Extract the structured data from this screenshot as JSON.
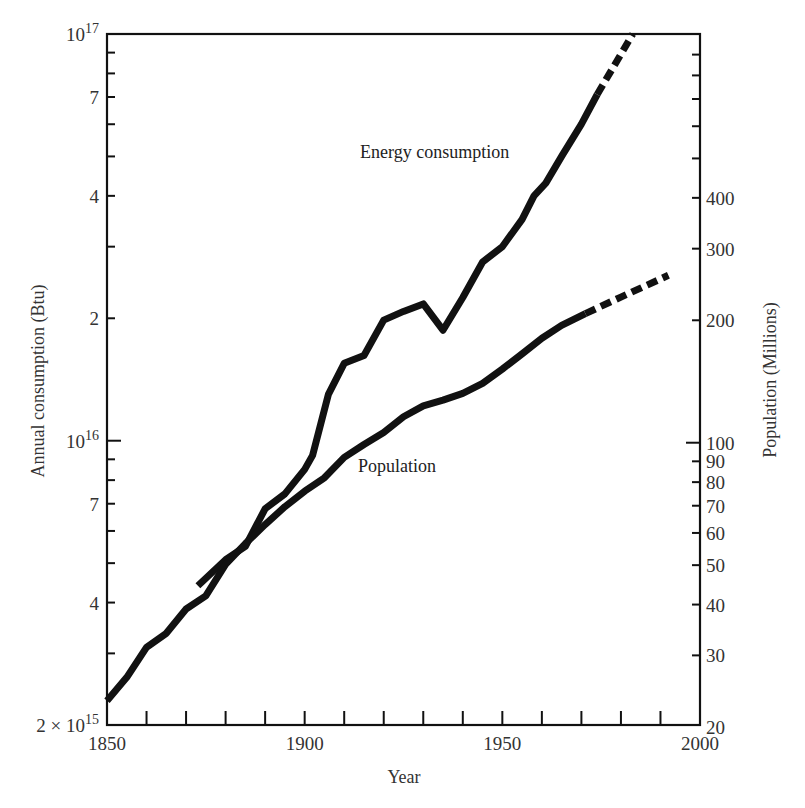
{
  "chart_data": {
    "type": "line",
    "title": "",
    "xlabel": "Year",
    "ylabel_left": "Annual consumption (Btu)",
    "ylabel_right": "Population (Millions)",
    "x_range": [
      1850,
      2000
    ],
    "x_ticks_major": [
      1850,
      1900,
      1950,
      2000
    ],
    "x_tick_step": 10,
    "y_left_scale": "log",
    "y_left_range": [
      2000000000000000.0,
      1e+17
    ],
    "y_left_ticks": [
      {
        "value": 2000000000000000.0,
        "label": "2 × 10",
        "sup": "15"
      },
      {
        "value": 4000000000000000.0,
        "label": "4"
      },
      {
        "value": 7000000000000000.0,
        "label": "7"
      },
      {
        "value": 1e+16,
        "label": "10",
        "sup": "16"
      },
      {
        "value": 2e+16,
        "label": "2"
      },
      {
        "value": 4e+16,
        "label": "4"
      },
      {
        "value": 7e+16,
        "label": "7"
      },
      {
        "value": 1e+17,
        "label": "10",
        "sup": "17"
      }
    ],
    "y_left_minor": [
      3000000000000000.0,
      5000000000000000.0,
      6000000000000000.0,
      8000000000000000.0,
      9000000000000000.0,
      3e+16,
      5e+16,
      6e+16,
      8e+16,
      9e+16
    ],
    "y_right_scale": "log",
    "y_right_range": [
      20,
      500
    ],
    "y_right_ticks": [
      20,
      30,
      40,
      50,
      60,
      70,
      80,
      90,
      100,
      200,
      300,
      400
    ],
    "y_right_minor": [
      500,
      600,
      700,
      800,
      900
    ],
    "series": [
      {
        "name": "Energy consumption",
        "axis": "left",
        "points": [
          [
            1873,
            4400000000000000.0
          ],
          [
            1880,
            5100000000000000.0
          ],
          [
            1885,
            5500000000000000.0
          ],
          [
            1890,
            6800000000000000.0
          ],
          [
            1895,
            7400000000000000.0
          ],
          [
            1900,
            8500000000000000.0
          ],
          [
            1902,
            9200000000000000.0
          ],
          [
            1906,
            1.3e+16
          ],
          [
            1910,
            1.55e+16
          ],
          [
            1915,
            1.62e+16
          ],
          [
            1920,
            1.98e+16
          ],
          [
            1925,
            2.08e+16
          ],
          [
            1930,
            2.17e+16
          ],
          [
            1935,
            1.87e+16
          ],
          [
            1940,
            2.25e+16
          ],
          [
            1945,
            2.75e+16
          ],
          [
            1950,
            3e+16
          ],
          [
            1955,
            3.5e+16
          ],
          [
            1958,
            4e+16
          ],
          [
            1961,
            4.3e+16
          ],
          [
            1965,
            5e+16
          ],
          [
            1970,
            6e+16
          ],
          [
            1974,
            7.1e+16
          ]
        ],
        "projected": [
          [
            1974,
            7.1e+16
          ],
          [
            1983,
            1e+17
          ]
        ]
      },
      {
        "name": "Population",
        "axis": "right",
        "points": [
          [
            1850,
            23.2
          ],
          [
            1855,
            26.5
          ],
          [
            1860,
            31.4
          ],
          [
            1865,
            34.0
          ],
          [
            1870,
            39.0
          ],
          [
            1875,
            42.0
          ],
          [
            1880,
            50.2
          ],
          [
            1885,
            56.5
          ],
          [
            1890,
            62.9
          ],
          [
            1895,
            69.6
          ],
          [
            1900,
            76.0
          ],
          [
            1905,
            82.0
          ],
          [
            1910,
            92.0
          ],
          [
            1915,
            99.0
          ],
          [
            1920,
            106.0
          ],
          [
            1925,
            115.8
          ],
          [
            1930,
            123.2
          ],
          [
            1935,
            127.3
          ],
          [
            1940,
            132.2
          ],
          [
            1945,
            139.9
          ],
          [
            1950,
            151.7
          ],
          [
            1955,
            165.3
          ],
          [
            1960,
            180.7
          ],
          [
            1965,
            194.3
          ],
          [
            1971,
            207.7
          ]
        ],
        "projected": [
          [
            1971,
            207.7
          ],
          [
            1980,
            228.0
          ],
          [
            1992,
            258.0
          ]
        ]
      }
    ],
    "annotations": [
      {
        "text": "Energy consumption",
        "near": [
          1935,
          5.2e+16
        ]
      },
      {
        "text": "Population",
        "near": [
          1935,
          9800000000000000.0
        ]
      }
    ],
    "grid": false,
    "legend": "none (inline labels)"
  },
  "labels": {
    "energy": "Energy consumption",
    "population": "Population",
    "xlabel": "Year",
    "ylabel_left": "Annual consumption (Btu)",
    "ylabel_right": "Population (Millions)"
  }
}
